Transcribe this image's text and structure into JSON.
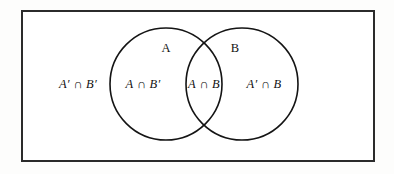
{
  "figure": {
    "type": "venn-diagram",
    "background_color": "#fdfdfc",
    "universe": {
      "name": "universal-set-rectangle",
      "border_color": "#2b2b2b",
      "fill_color": "#ffffff"
    },
    "circles": {
      "stroke_color": "#141414",
      "fill": "none",
      "left": {
        "label": "A",
        "cx": 166,
        "cy": 84,
        "r": 56
      },
      "right": {
        "label": "B",
        "cx": 242,
        "cy": 84,
        "r": 56
      }
    }
  },
  "labels": {
    "set_a": "A",
    "set_b": "B",
    "outside_region": "A′ ∩ B′",
    "a_only_region": "A ∩ B′",
    "intersection_region": "A ∩ B",
    "b_only_region": "A′ ∩ B"
  }
}
